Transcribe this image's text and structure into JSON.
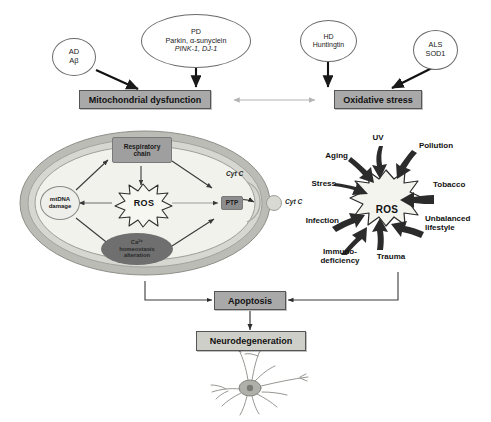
{
  "disease_nodes": [
    {
      "id": "ad",
      "lines": [
        "AD",
        "Aβ"
      ]
    },
    {
      "id": "pd",
      "lines": [
        "PD",
        "Parkin, α-sunyclein",
        "PINK-1, DJ-1"
      ]
    },
    {
      "id": "hd",
      "lines": [
        "HD",
        "Huntingtin"
      ]
    },
    {
      "id": "als",
      "lines": [
        "ALS",
        "SOD1"
      ]
    }
  ],
  "process_boxes": {
    "mitochondrial_dysfunction": "Mitochondrial dysfunction",
    "oxidative_stress": "Oxidative stress",
    "apoptosis": "Apoptosis",
    "neurodegeneration": "Neurodegeneration"
  },
  "mitochondrion": {
    "respiratory_chain": [
      "Respiratory",
      "chain"
    ],
    "mtdna_damage": [
      "mtDNA",
      "damage"
    ],
    "ros": "ROS",
    "calcium": [
      "Ca²⁺",
      "homeostasis",
      "alteration"
    ],
    "ptp": "PTP",
    "cyt_c_inner": "Cyt C",
    "cyt_c_outer": "Cyt C"
  },
  "ros_burst": {
    "center": "ROS",
    "factors": [
      {
        "id": "uv",
        "label": "UV"
      },
      {
        "id": "pollution",
        "label": "Pollution"
      },
      {
        "id": "tobacco",
        "label": "Tobacco"
      },
      {
        "id": "unbalanced",
        "label": "Unbalanced\nlifestyle"
      },
      {
        "id": "trauma",
        "label": "Trauma"
      },
      {
        "id": "immuno",
        "label": "Immuno-\ndeficiency"
      },
      {
        "id": "infection",
        "label": "Infection"
      },
      {
        "id": "stress",
        "label": "Stress"
      },
      {
        "id": "aging",
        "label": "Aging"
      }
    ]
  },
  "colors": {
    "box_gray": "#a9a9a9",
    "box_border": "#555555",
    "membrane_outer": "#b9b9b4",
    "membrane_inner": "#efefe9",
    "arrow_dark": "#1a1a1a",
    "arrow_light": "#b9b9b9",
    "oval_dark": "#6f6f6f",
    "burst_fill": "#f2f2ee"
  }
}
